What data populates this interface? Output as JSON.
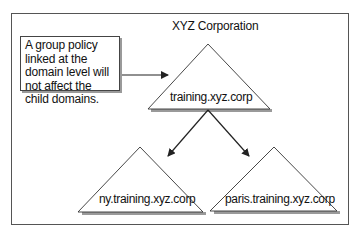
{
  "diagram": {
    "title": "XYZ Corporation",
    "callout": {
      "text": "A group policy linked at the domain level will not affect the child domains."
    },
    "nodes": [
      {
        "id": "parent",
        "label": "training.xyz.corp"
      },
      {
        "id": "child-ny",
        "label": "ny.training.xyz.corp"
      },
      {
        "id": "child-paris",
        "label": "paris.training.xyz.corp"
      }
    ],
    "edges": [
      {
        "from": "callout",
        "to": "parent"
      },
      {
        "from": "parent",
        "to": "child-ny"
      },
      {
        "from": "parent",
        "to": "child-paris"
      }
    ],
    "colors": {
      "stroke": "#333333",
      "shadow": "#9a9a9a",
      "background": "#ffffff"
    }
  }
}
